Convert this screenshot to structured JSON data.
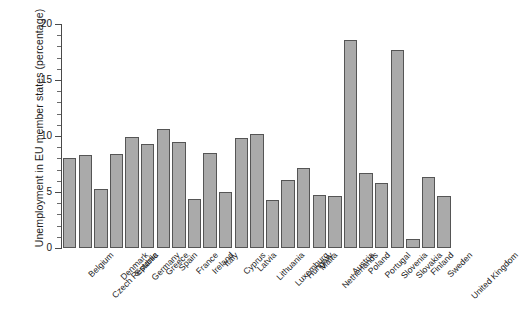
{
  "chart_data": {
    "type": "bar",
    "title": "",
    "xlabel": "",
    "ylabel": "Unemployment in EU member states (percentage)",
    "ylim": [
      0,
      20
    ],
    "yticks": [
      0,
      5,
      10,
      15,
      20
    ],
    "ytick_labels": [
      "0",
      "5",
      "10",
      "15",
      "20"
    ],
    "grid": false,
    "legend": null,
    "bar_color": "#aaaaaa",
    "bar_edge_color": "#555555",
    "categories": [
      "Belgium",
      "Czech Republic",
      "Denmark",
      "Estonia",
      "Germany",
      "Greece",
      "Spain",
      "France",
      "Ireland",
      "Italy",
      "Cyprus",
      "Latvia",
      "Lithuania",
      "Luxemburg",
      "Hungary",
      "Malta",
      "Netherlands",
      "Austria",
      "Poland",
      "Portugal",
      "Slovenia",
      "Slovakia",
      "Finland",
      "Sweden",
      "United Kingdom"
    ],
    "values": [
      8.0,
      8.3,
      5.3,
      8.4,
      9.9,
      9.3,
      10.6,
      9.5,
      4.4,
      8.5,
      5.0,
      9.8,
      10.2,
      4.3,
      6.1,
      7.1,
      4.7,
      4.6,
      18.6,
      6.7,
      5.8,
      17.7,
      0.8,
      6.3,
      4.6
    ]
  }
}
